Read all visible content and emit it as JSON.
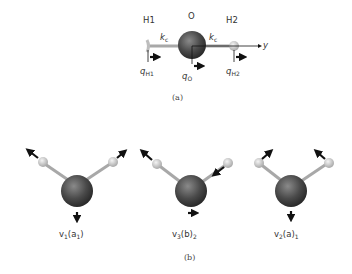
{
  "part_a": {
    "caption": "(a)",
    "atoms": {
      "h1": "H1",
      "o": "O",
      "h2": "H2"
    },
    "springs": {
      "left": "k",
      "left_sub": "c",
      "right": "k",
      "right_sub": "c"
    },
    "axis": "y",
    "coords": {
      "h1": {
        "q": "q",
        "sub": "H1"
      },
      "o": {
        "q": "q",
        "sub": "O"
      },
      "h2": {
        "q": "q",
        "sub": "H2"
      }
    }
  },
  "part_b": {
    "caption": "(b)",
    "modes": [
      {
        "name": "v",
        "sub": "1",
        "sym": "(a",
        "sym_sub": "1",
        "close": ")"
      },
      {
        "name": "v",
        "sub": "3",
        "sym": "(b)",
        "sym_sub": "2",
        "close": ""
      },
      {
        "name": "v",
        "sub": "2",
        "sym": "(a)",
        "sym_sub": "1",
        "close": ""
      }
    ]
  },
  "colors": {
    "oxygen": "#4a4a4a",
    "hydrogen": "#d8d8d8",
    "bond": "#a8a8a8",
    "arrow": "#111111"
  }
}
